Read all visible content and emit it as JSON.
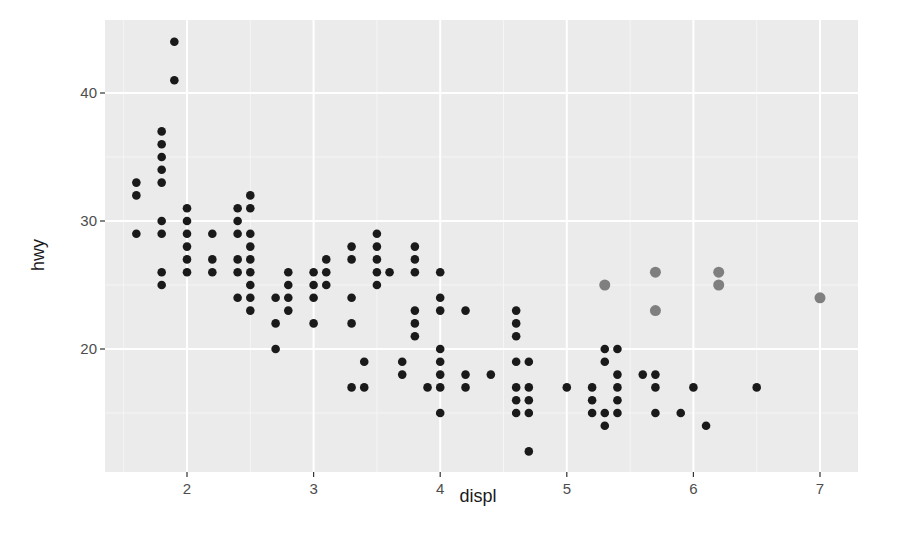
{
  "chart_data": {
    "type": "scatter",
    "title": "",
    "xlabel": "displ",
    "ylabel": "hwy",
    "xlim": [
      1.35,
      7.3
    ],
    "ylim": [
      10.4,
      45.2
    ],
    "x_ticks": [
      2,
      3,
      4,
      5,
      6,
      7
    ],
    "y_ticks": [
      20,
      30,
      40
    ],
    "grid": true,
    "legend": "none",
    "colors": {
      "panel": "#ebebeb",
      "grid_major": "#ffffff",
      "grid_minor": "#f5f5f5",
      "point": "#1a1a1a",
      "highlight": "#7f7f7f"
    },
    "series": [
      {
        "name": "cars",
        "color": "#1a1a1a",
        "points": [
          [
            1.6,
            33
          ],
          [
            1.6,
            32
          ],
          [
            1.6,
            29
          ],
          [
            1.8,
            37
          ],
          [
            1.8,
            36
          ],
          [
            1.8,
            35
          ],
          [
            1.8,
            34
          ],
          [
            1.8,
            33
          ],
          [
            1.8,
            30
          ],
          [
            1.8,
            29
          ],
          [
            1.8,
            26
          ],
          [
            1.8,
            25
          ],
          [
            1.9,
            44
          ],
          [
            1.9,
            41
          ],
          [
            2.0,
            31
          ],
          [
            2.0,
            30
          ],
          [
            2.0,
            29
          ],
          [
            2.0,
            28
          ],
          [
            2.0,
            27
          ],
          [
            2.0,
            26
          ],
          [
            2.2,
            29
          ],
          [
            2.2,
            27
          ],
          [
            2.2,
            26
          ],
          [
            2.4,
            31
          ],
          [
            2.4,
            30
          ],
          [
            2.4,
            29
          ],
          [
            2.4,
            27
          ],
          [
            2.4,
            26
          ],
          [
            2.4,
            24
          ],
          [
            2.5,
            32
          ],
          [
            2.5,
            31
          ],
          [
            2.5,
            29
          ],
          [
            2.5,
            28
          ],
          [
            2.5,
            27
          ],
          [
            2.5,
            26
          ],
          [
            2.5,
            25
          ],
          [
            2.5,
            24
          ],
          [
            2.5,
            23
          ],
          [
            2.7,
            24
          ],
          [
            2.7,
            22
          ],
          [
            2.7,
            20
          ],
          [
            2.8,
            26
          ],
          [
            2.8,
            25
          ],
          [
            2.8,
            24
          ],
          [
            2.8,
            23
          ],
          [
            3.0,
            26
          ],
          [
            3.0,
            25
          ],
          [
            3.0,
            24
          ],
          [
            3.0,
            22
          ],
          [
            3.1,
            27
          ],
          [
            3.1,
            26
          ],
          [
            3.1,
            25
          ],
          [
            3.3,
            28
          ],
          [
            3.3,
            27
          ],
          [
            3.3,
            24
          ],
          [
            3.3,
            22
          ],
          [
            3.3,
            17
          ],
          [
            3.4,
            19
          ],
          [
            3.4,
            17
          ],
          [
            3.5,
            29
          ],
          [
            3.5,
            28
          ],
          [
            3.5,
            27
          ],
          [
            3.5,
            26
          ],
          [
            3.5,
            25
          ],
          [
            3.6,
            26
          ],
          [
            3.7,
            19
          ],
          [
            3.7,
            18
          ],
          [
            3.8,
            28
          ],
          [
            3.8,
            27
          ],
          [
            3.8,
            26
          ],
          [
            3.8,
            23
          ],
          [
            3.8,
            22
          ],
          [
            3.8,
            21
          ],
          [
            3.9,
            17
          ],
          [
            4.0,
            26
          ],
          [
            4.0,
            24
          ],
          [
            4.0,
            23
          ],
          [
            4.0,
            20
          ],
          [
            4.0,
            19
          ],
          [
            4.0,
            18
          ],
          [
            4.0,
            17
          ],
          [
            4.0,
            15
          ],
          [
            4.2,
            23
          ],
          [
            4.2,
            18
          ],
          [
            4.2,
            17
          ],
          [
            4.4,
            18
          ],
          [
            4.6,
            23
          ],
          [
            4.6,
            22
          ],
          [
            4.6,
            21
          ],
          [
            4.6,
            19
          ],
          [
            4.6,
            17
          ],
          [
            4.6,
            16
          ],
          [
            4.6,
            15
          ],
          [
            4.7,
            19
          ],
          [
            4.7,
            17
          ],
          [
            4.7,
            16
          ],
          [
            4.7,
            15
          ],
          [
            4.7,
            12
          ],
          [
            5.0,
            17
          ],
          [
            5.2,
            17
          ],
          [
            5.2,
            16
          ],
          [
            5.2,
            15
          ],
          [
            5.3,
            20
          ],
          [
            5.3,
            19
          ],
          [
            5.3,
            15
          ],
          [
            5.3,
            14
          ],
          [
            5.4,
            20
          ],
          [
            5.4,
            18
          ],
          [
            5.4,
            17
          ],
          [
            5.4,
            16
          ],
          [
            5.4,
            15
          ],
          [
            5.6,
            18
          ],
          [
            5.7,
            18
          ],
          [
            5.7,
            17
          ],
          [
            5.7,
            15
          ],
          [
            5.9,
            15
          ],
          [
            6.0,
            17
          ],
          [
            6.1,
            14
          ],
          [
            6.5,
            17
          ]
        ]
      },
      {
        "name": "highlighted",
        "color": "#7f7f7f",
        "points": [
          [
            5.3,
            25
          ],
          [
            5.7,
            26
          ],
          [
            5.7,
            23
          ],
          [
            6.2,
            26
          ],
          [
            6.2,
            25
          ],
          [
            7.0,
            24
          ]
        ]
      }
    ]
  }
}
